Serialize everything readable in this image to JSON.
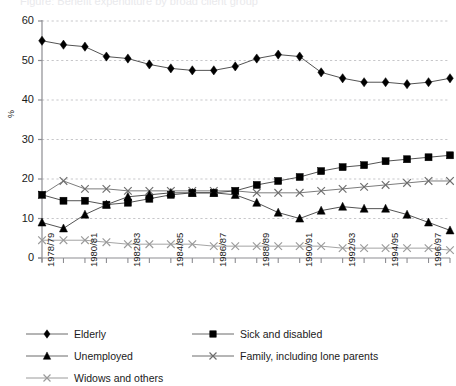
{
  "figure": {
    "clipped_title": "Figure: Benefit expenditure by broad client group",
    "ylabel": "%"
  },
  "chart_data": {
    "type": "line",
    "title": "",
    "subtitle": "",
    "xlabel": "",
    "ylabel": "%",
    "ylim": [
      0,
      60
    ],
    "yticks": [
      0,
      10,
      20,
      30,
      40,
      50,
      60
    ],
    "grid": true,
    "grid_axis": "y",
    "legend_position": "bottom-left",
    "x": [
      "1978/79",
      "1979/80",
      "1980/81",
      "1981/82",
      "1982/83",
      "1983/84",
      "1984/85",
      "1985/86",
      "1986/87",
      "1987/88",
      "1988/89",
      "1989/90",
      "1990/91",
      "1991/92",
      "1992/93",
      "1993/94",
      "1994/95",
      "1995/96",
      "1996/97",
      "1997/98"
    ],
    "xtick_labels": [
      "1978/79",
      "1980/81",
      "1982/83",
      "1984/85",
      "1986/87",
      "1988/89",
      "1990/91",
      "1992/93",
      "1994/95",
      "1996/97"
    ],
    "xtick_every": 2,
    "series": [
      {
        "name": "Elderly",
        "marker": "diamond",
        "color": "#000000",
        "values": [
          55,
          54,
          53.5,
          51,
          50.5,
          49,
          48,
          47.5,
          47.5,
          48.5,
          50.5,
          51.5,
          51,
          47,
          45.5,
          44.5,
          44.5,
          44,
          44.5,
          45.5
        ]
      },
      {
        "name": "Sick and disabled",
        "marker": "square",
        "color": "#000000",
        "values": [
          16,
          14.5,
          14.5,
          13.5,
          14,
          15,
          16,
          16.5,
          16.5,
          17,
          18.5,
          19.5,
          20.5,
          22,
          23,
          23.5,
          24.5,
          25,
          25.5,
          26
        ]
      },
      {
        "name": "Unemployed",
        "marker": "triangle",
        "color": "#000000",
        "values": [
          9,
          7.5,
          11,
          13.5,
          15.5,
          16,
          16.5,
          16.5,
          16.5,
          16,
          14,
          11.5,
          10,
          12,
          13,
          12.5,
          12.5,
          11,
          9,
          7
        ]
      },
      {
        "name": "Family, including lone parents",
        "marker": "x",
        "color": "#6d6d6d",
        "values": [
          16,
          19.5,
          17.5,
          17.5,
          17,
          17,
          17,
          17,
          17,
          17,
          16.5,
          16.5,
          16.5,
          17,
          17.5,
          18,
          18.5,
          19,
          19.5,
          19.5
        ]
      },
      {
        "name": "Widows and others",
        "marker": "x",
        "color": "#9a9a9a",
        "values": [
          4.5,
          4.5,
          4.5,
          4,
          3.5,
          3.5,
          3.5,
          3.5,
          3,
          3,
          3,
          3,
          3,
          3,
          2.5,
          2.5,
          2.5,
          2.5,
          2.5,
          2
        ]
      }
    ]
  },
  "legend": {
    "items": [
      {
        "label": "Elderly",
        "marker": "diamond-icon"
      },
      {
        "label": "Sick and disabled",
        "marker": "square-icon"
      },
      {
        "label": "Unemployed",
        "marker": "triangle-icon"
      },
      {
        "label": "Family, including lone parents",
        "marker": "x-icon"
      },
      {
        "label": "Widows and others",
        "marker": "x-icon"
      }
    ]
  }
}
